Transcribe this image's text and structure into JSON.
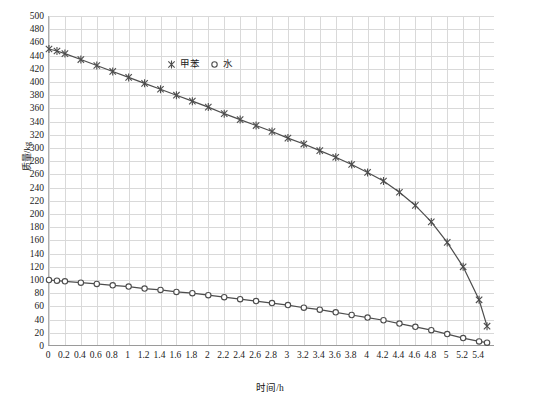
{
  "chart_data": {
    "type": "line",
    "title": "",
    "xlabel": "时间/h",
    "ylabel": "质量/kg",
    "xlim": [
      0,
      5.6
    ],
    "ylim": [
      0,
      500
    ],
    "grid": true,
    "legend_position": "top-center",
    "x_ticks": [
      "0",
      "0.2",
      "0.4",
      "0.6",
      "0.8",
      "1",
      "1.2",
      "1.4",
      "1.6",
      "1.8",
      "2",
      "2.2",
      "2.4",
      "2.6",
      "2.8",
      "3",
      "3.2",
      "3.4",
      "3.6",
      "3.8",
      "4",
      "4.2",
      "4.4",
      "4.6",
      "4.8",
      "5",
      "5.2",
      "5.4"
    ],
    "y_ticks": [
      "0",
      "20",
      "40",
      "60",
      "80",
      "100",
      "120",
      "140",
      "160",
      "180",
      "200",
      "220",
      "240",
      "260",
      "280",
      "300",
      "320",
      "340",
      "360",
      "380",
      "400",
      "420",
      "440",
      "460",
      "480",
      "500"
    ],
    "x": [
      0,
      0.1,
      0.2,
      0.4,
      0.6,
      0.8,
      1.0,
      1.2,
      1.4,
      1.6,
      1.8,
      2.0,
      2.2,
      2.4,
      2.6,
      2.8,
      3.0,
      3.2,
      3.4,
      3.6,
      3.8,
      4.0,
      4.2,
      4.4,
      4.6,
      4.8,
      5.0,
      5.2,
      5.4,
      5.5
    ],
    "series": [
      {
        "name": "甲苯",
        "marker": "cross",
        "color": "#4d4d4d",
        "values": [
          450,
          447,
          443,
          434,
          425,
          416,
          407,
          398,
          389,
          380,
          371,
          362,
          352,
          343,
          334,
          325,
          315,
          306,
          296,
          286,
          275,
          263,
          250,
          233,
          213,
          188,
          157,
          120,
          70,
          30
        ]
      },
      {
        "name": "水",
        "marker": "circle",
        "color": "#4d4d4d",
        "values": [
          100,
          99,
          98,
          96,
          94,
          92,
          90,
          87,
          85,
          82,
          80,
          77,
          74,
          71,
          68,
          65,
          62,
          58,
          55,
          51,
          47,
          43,
          39,
          34,
          29,
          24,
          18,
          12,
          7,
          5
        ]
      }
    ]
  },
  "legend": {
    "entries": [
      {
        "label": "甲苯",
        "marker": "cross-marker-icon"
      },
      {
        "label": "水",
        "marker": "circle-marker-icon"
      }
    ]
  }
}
